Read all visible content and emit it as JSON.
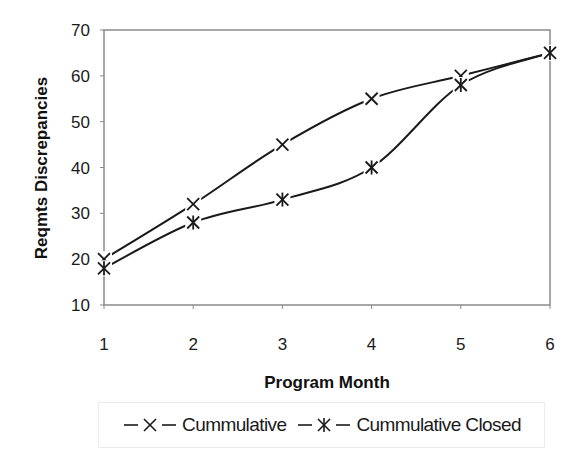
{
  "chart_data": {
    "type": "line",
    "title": "",
    "xlabel": "Program Month",
    "ylabel": "Reqmts Discrepancies",
    "x": [
      1,
      2,
      3,
      4,
      5,
      6
    ],
    "x_tick_labels": [
      "1",
      "2",
      "3",
      "4",
      "5",
      "6"
    ],
    "y_tick_labels": [
      "10",
      "20",
      "30",
      "40",
      "50",
      "60",
      "70"
    ],
    "xlim": [
      1,
      6
    ],
    "ylim": [
      10,
      70
    ],
    "grid": false,
    "legend_position": "bottom",
    "series": [
      {
        "name": "Cummulative",
        "marker": "x",
        "color": "#1a1a1a",
        "values": [
          20,
          32,
          45,
          55,
          60,
          65
        ]
      },
      {
        "name": "Cummulative Closed",
        "marker": "asterisk",
        "color": "#1a1a1a",
        "values": [
          18,
          28,
          33,
          40,
          58,
          65
        ]
      }
    ]
  },
  "legend": {
    "items": [
      {
        "label": "Cummulative",
        "icon": "x-marker-icon"
      },
      {
        "label": "Cummulative Closed",
        "icon": "asterisk-marker-icon"
      }
    ]
  }
}
